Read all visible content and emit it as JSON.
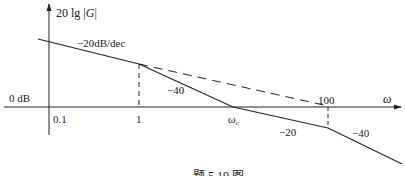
{
  "figure": {
    "caption": "题 5.19 图",
    "y_axis_label_prefix": "20 lg",
    "y_axis_label_var": "G",
    "x_axis_label": "ω",
    "zero_db_label": "0 dB",
    "ticks": {
      "t01": "0.1",
      "t1": "1",
      "t100": "100",
      "wc": "ω",
      "wc_sub": "c"
    },
    "slopes": {
      "first": "−20dB/dec",
      "second": "−40",
      "third": "−20",
      "fourth": "−40"
    },
    "colors": {
      "line": "#222222",
      "background": "#ffffff"
    }
  }
}
